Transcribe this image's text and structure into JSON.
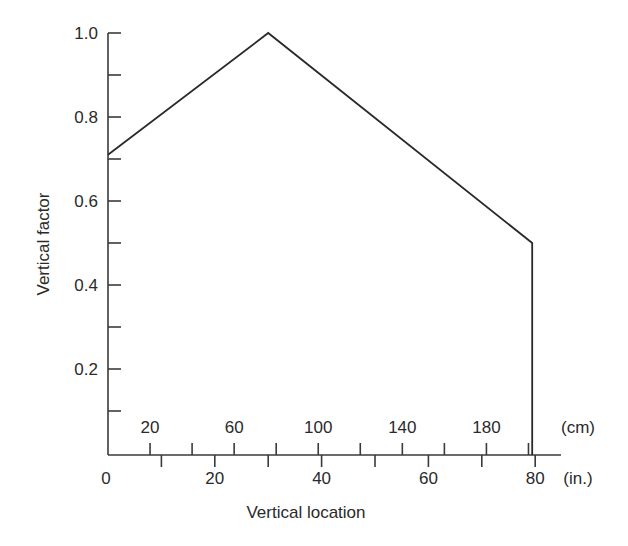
{
  "chart_data": {
    "type": "line",
    "title": "",
    "xlabel": "Vertical location",
    "ylabel": "Vertical factor",
    "x_unit_primary": "(in.)",
    "x_unit_secondary": "(cm)",
    "xlim": [
      0,
      80
    ],
    "ylim": [
      0,
      1.0
    ],
    "grid": false,
    "legend": null,
    "x_ticks_in": [
      0,
      20,
      40,
      60,
      80
    ],
    "x_minor_ticks_in": [
      10,
      30,
      50,
      70
    ],
    "x_ticks_cm": [
      20,
      60,
      100,
      140,
      180
    ],
    "x_minor_ticks_cm": [
      40,
      80,
      120,
      160,
      200
    ],
    "y_ticks": [
      0.2,
      0.4,
      0.6,
      0.8,
      1.0
    ],
    "y_tick_labels": [
      "0.2",
      "0.4",
      "0.6",
      "0.8",
      "1.0"
    ],
    "y_minor_ticks": [
      0.1,
      0.3,
      0.5,
      0.7,
      0.9
    ],
    "series": [
      {
        "name": "Vertical factor",
        "x": [
          0,
          30,
          80,
          80
        ],
        "y": [
          0.71,
          1.0,
          0.5,
          0.0
        ]
      }
    ]
  },
  "labels": {
    "xlabel": "Vertical location",
    "ylabel": "Vertical factor",
    "unit_in": "(in.)",
    "unit_cm": "(cm)"
  }
}
